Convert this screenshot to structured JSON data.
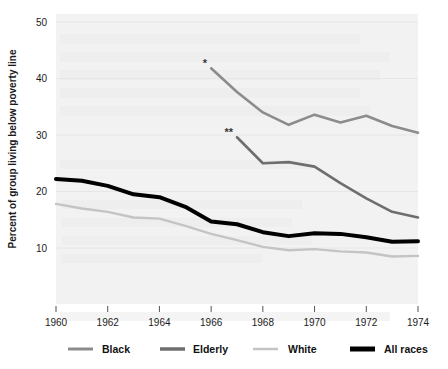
{
  "chart_data": {
    "type": "line",
    "title": "",
    "xlabel": "",
    "ylabel": "Percent of group living below poverty line",
    "xlim": [
      1960,
      1974
    ],
    "ylim": [
      0,
      50
    ],
    "yticks": [
      10,
      20,
      30,
      40,
      50
    ],
    "xticks": [
      1960,
      1962,
      1964,
      1966,
      1968,
      1970,
      1972,
      1974
    ],
    "grid": "horizontal-faint",
    "legend_position": "bottom",
    "plot_background": "#f2f2f2",
    "series": [
      {
        "name": "Black",
        "color": "#8c8c8c",
        "width": 2.6,
        "annotation": "*",
        "x": [
          1966,
          1967,
          1968,
          1969,
          1970,
          1971,
          1972,
          1973,
          1974
        ],
        "values": [
          41.8,
          37.6,
          34.0,
          31.8,
          33.6,
          32.2,
          33.4,
          31.6,
          30.4
        ]
      },
      {
        "name": "Elderly",
        "color": "#6e6e6e",
        "width": 2.6,
        "annotation": "**",
        "x": [
          1967,
          1968,
          1969,
          1970,
          1971,
          1972,
          1973,
          1974
        ],
        "values": [
          29.6,
          25.0,
          25.2,
          24.4,
          21.5,
          18.8,
          16.4,
          15.4
        ]
      },
      {
        "name": "White",
        "color": "#c4c4c4",
        "width": 2.4,
        "annotation": "",
        "x": [
          1960,
          1961,
          1962,
          1963,
          1964,
          1965,
          1966,
          1967,
          1968,
          1969,
          1970,
          1971,
          1972,
          1973,
          1974
        ],
        "values": [
          17.8,
          17.0,
          16.4,
          15.4,
          15.2,
          13.9,
          12.5,
          11.4,
          10.2,
          9.6,
          9.8,
          9.4,
          9.2,
          8.5,
          8.6
        ]
      },
      {
        "name": "All races",
        "color": "#000000",
        "width": 4.0,
        "annotation": "",
        "x": [
          1960,
          1961,
          1962,
          1963,
          1964,
          1965,
          1966,
          1967,
          1968,
          1969,
          1970,
          1971,
          1972,
          1973,
          1974
        ],
        "values": [
          22.2,
          21.9,
          21.0,
          19.5,
          19.0,
          17.3,
          14.7,
          14.2,
          12.8,
          12.1,
          12.6,
          12.5,
          11.9,
          11.1,
          11.2
        ]
      }
    ],
    "annotations": [
      {
        "label": "*",
        "x": 1966,
        "y": 41.8
      },
      {
        "label": "**",
        "x": 1967,
        "y": 29.6
      }
    ]
  },
  "legend": {
    "items": [
      {
        "label": "Black",
        "color": "#8c8c8c",
        "thickness": 3
      },
      {
        "label": "Elderly",
        "color": "#6e6e6e",
        "thickness": 3.5
      },
      {
        "label": "White",
        "color": "#c4c4c4",
        "thickness": 2.5
      },
      {
        "label": "All races",
        "color": "#000000",
        "thickness": 5
      }
    ]
  },
  "axes": {
    "y_title": "Percent of group living below poverty line",
    "y_labels": [
      "50",
      "40",
      "30",
      "20",
      "10"
    ],
    "x_labels": [
      "1960",
      "1962",
      "1964",
      "1966",
      "1968",
      "1970",
      "1972",
      "1974"
    ]
  }
}
